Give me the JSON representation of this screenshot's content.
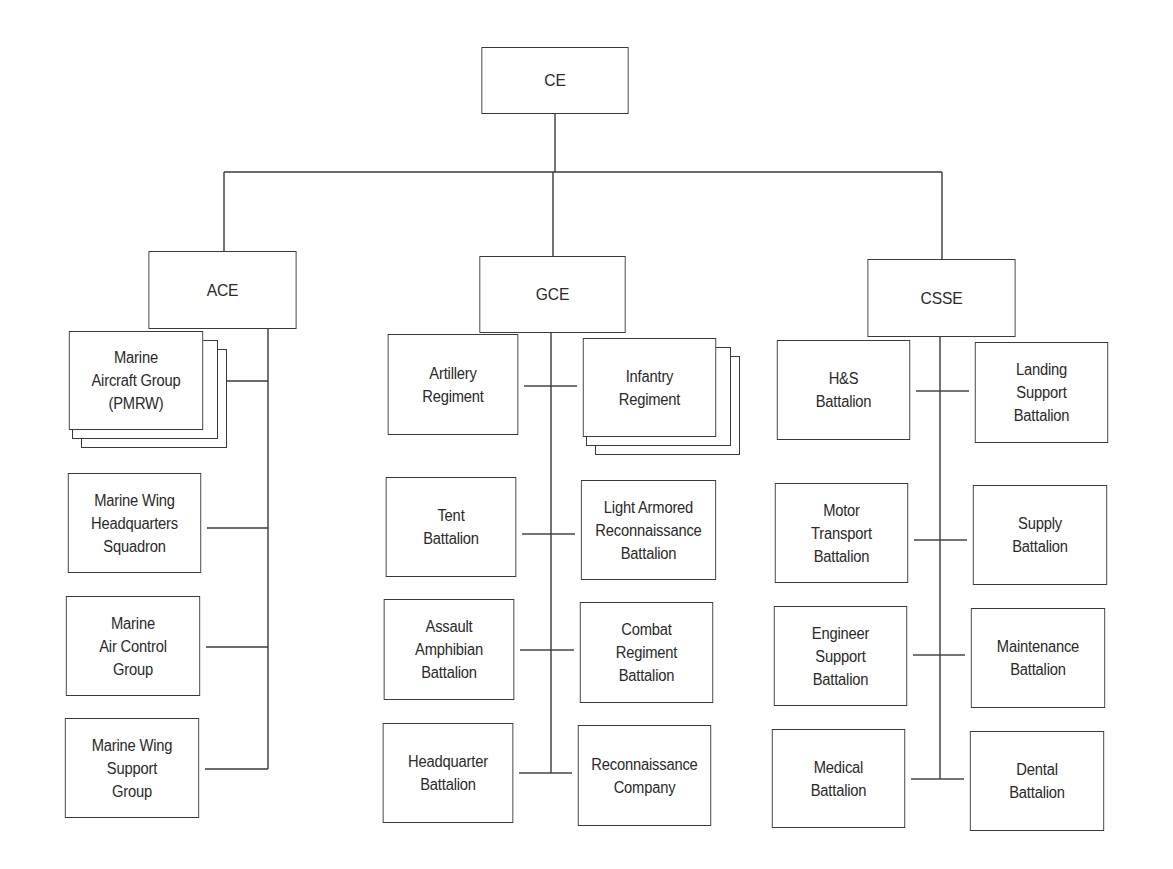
{
  "colors": {
    "line": "#3a3a3a",
    "text": "#2a2a2a",
    "background": "#ffffff"
  },
  "root": {
    "label": "CE",
    "x": 475,
    "y": 47,
    "w": 160,
    "h": 67
  },
  "bus_y": 172,
  "elements": [
    {
      "id": "ace",
      "label": "ACE",
      "x": 142,
      "y": 251,
      "w": 161,
      "h": 78,
      "drop_x": 224,
      "trunk_x": 268,
      "children": [
        {
          "label": "Marine\nAircraft Group\n(PMRW)",
          "x": 63,
          "y": 331,
          "w": 146,
          "h": 99,
          "side": "left",
          "conn_y": 381,
          "stacked": true
        },
        {
          "label": "Marine Wing\nHeadquarters\nSquadron",
          "x": 62,
          "y": 473,
          "w": 145,
          "h": 100,
          "side": "left",
          "conn_y": 528,
          "stacked": false
        },
        {
          "label": "Marine\nAir Control\nGroup",
          "x": 60,
          "y": 596,
          "w": 146,
          "h": 100,
          "side": "left",
          "conn_y": 647,
          "stacked": false
        },
        {
          "label": "Marine Wing\nSupport\nGroup",
          "x": 59,
          "y": 718,
          "w": 146,
          "h": 100,
          "side": "left",
          "conn_y": 769,
          "stacked": false
        }
      ]
    },
    {
      "id": "gce",
      "label": "GCE",
      "x": 473,
      "y": 256,
      "w": 159,
      "h": 77,
      "drop_x": 553,
      "trunk_x": 551,
      "children": [
        {
          "label": "Artillery\nRegiment",
          "x": 382,
          "y": 334,
          "w": 142,
          "h": 101,
          "side": "left",
          "conn_y": 386,
          "stacked": false
        },
        {
          "label": "Infantry\nRegiment",
          "x": 577,
          "y": 338,
          "w": 145,
          "h": 99,
          "side": "right",
          "conn_y": 386,
          "stacked": true
        },
        {
          "label": "Tent\nBattalion",
          "x": 380,
          "y": 477,
          "w": 142,
          "h": 100,
          "side": "left",
          "conn_y": 534,
          "stacked": false
        },
        {
          "label": "Light Armored\nReconnaissance\nBattalion",
          "x": 575,
          "y": 480,
          "w": 147,
          "h": 100,
          "side": "right",
          "conn_y": 534,
          "stacked": false
        },
        {
          "label": "Assault\nAmphibian\nBattalion",
          "x": 378,
          "y": 599,
          "w": 142,
          "h": 101,
          "side": "left",
          "conn_y": 650,
          "stacked": false
        },
        {
          "label": "Combat\nRegiment\nBattalion",
          "x": 574,
          "y": 602,
          "w": 145,
          "h": 101,
          "side": "right",
          "conn_y": 650,
          "stacked": false
        },
        {
          "label": "Headquarter\nBattalion",
          "x": 377,
          "y": 723,
          "w": 142,
          "h": 100,
          "side": "left",
          "conn_y": 773,
          "stacked": false
        },
        {
          "label": "Reconnaissance\nCompany",
          "x": 572,
          "y": 725,
          "w": 145,
          "h": 101,
          "side": "right",
          "conn_y": 773,
          "stacked": false
        }
      ]
    },
    {
      "id": "csse",
      "label": "CSSE",
      "x": 861,
      "y": 259,
      "w": 161,
      "h": 78,
      "drop_x": 942,
      "trunk_x": 940,
      "children": [
        {
          "label": "H&S\nBattalion",
          "x": 771,
          "y": 340,
          "w": 145,
          "h": 100,
          "side": "left",
          "conn_y": 391,
          "stacked": false
        },
        {
          "label": "Landing\nSupport\nBattalion",
          "x": 969,
          "y": 342,
          "w": 145,
          "h": 101,
          "side": "right",
          "conn_y": 391,
          "stacked": false
        },
        {
          "label": "Motor\nTransport\nBattalion",
          "x": 769,
          "y": 483,
          "w": 145,
          "h": 100,
          "side": "left",
          "conn_y": 540,
          "stacked": false
        },
        {
          "label": "Supply\nBattalion",
          "x": 967,
          "y": 485,
          "w": 146,
          "h": 100,
          "side": "right",
          "conn_y": 540,
          "stacked": false
        },
        {
          "label": "Engineer\nSupport\nBattalion",
          "x": 768,
          "y": 606,
          "w": 145,
          "h": 100,
          "side": "left",
          "conn_y": 655,
          "stacked": false
        },
        {
          "label": "Maintenance\nBattalion",
          "x": 965,
          "y": 608,
          "w": 146,
          "h": 100,
          "side": "right",
          "conn_y": 655,
          "stacked": false
        },
        {
          "label": "Medical\nBattalion",
          "x": 766,
          "y": 729,
          "w": 145,
          "h": 99,
          "side": "left",
          "conn_y": 779,
          "stacked": false
        },
        {
          "label": "Dental\nBattalion",
          "x": 964,
          "y": 731,
          "w": 146,
          "h": 100,
          "side": "right",
          "conn_y": 779,
          "stacked": false
        }
      ]
    }
  ]
}
